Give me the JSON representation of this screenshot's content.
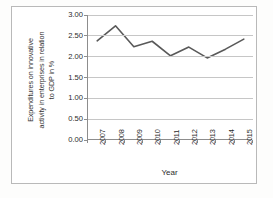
{
  "chart_data": {
    "type": "line",
    "title": "",
    "xlabel": "Year",
    "ylabel": "Expenditures on innovative activity in enterprises in relation to GDP in %",
    "ylabel_lines": [
      "Expenditures on innovative",
      "activity in enterprises in relation",
      "to GDP in %"
    ],
    "categories": [
      "2007",
      "2008",
      "2009",
      "2010",
      "2011",
      "2012",
      "2013",
      "2014",
      "2015"
    ],
    "values": [
      2.38,
      2.74,
      2.24,
      2.37,
      2.02,
      2.23,
      1.97,
      2.18,
      2.42
    ],
    "ylim": [
      0.0,
      3.0
    ],
    "ytick_step": 0.5,
    "ytick_labels": [
      "0.00",
      "0.50",
      "1.00",
      "1.50",
      "2.00",
      "2.50",
      "3.00"
    ],
    "ytick_values": [
      0.0,
      0.5,
      1.0,
      1.5,
      2.0,
      2.5,
      3.0
    ],
    "grid": true,
    "grid_axis": "y",
    "legend": false,
    "legend_position": "none",
    "series_color": "#595959",
    "gridline_color": "#c6c6c6",
    "axis_color": "#8d8d8d",
    "frame_color": "#b9b9b9",
    "background_color": "#ffffff",
    "line_width": 1.6,
    "markers": false
  }
}
